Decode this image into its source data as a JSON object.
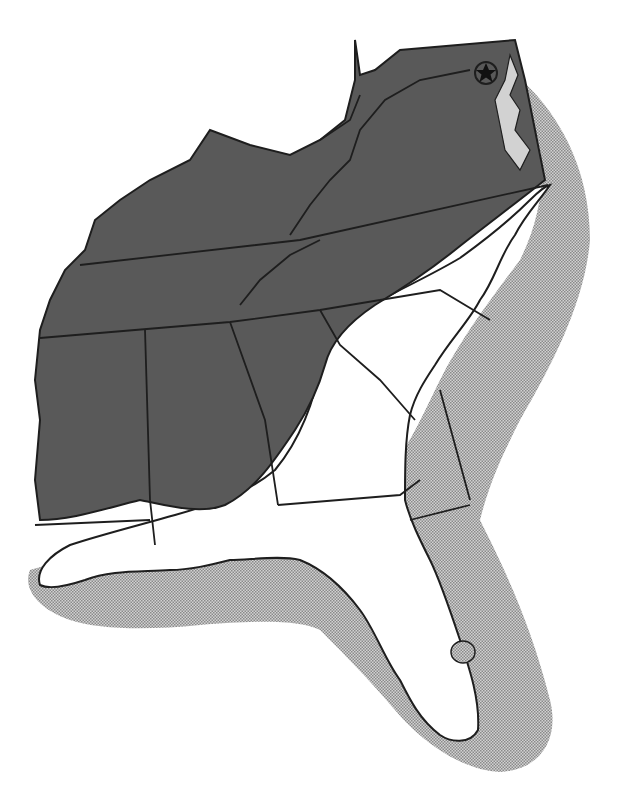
{
  "map": {
    "title": "",
    "region": "Southeastern United States",
    "colors": {
      "background": "#ffffff",
      "dark_range": "#595959",
      "light_stipple": "#b4b4b4",
      "land_unshaded": "#ffffff",
      "border": "#1e1e1e"
    },
    "legend": [],
    "layers": [
      {
        "name": "inland-range",
        "shade": "dark",
        "description": "Dark gray shaded inland range covering piedmont/mountain interior"
      },
      {
        "name": "coastal-range",
        "shade": "light-stipple",
        "description": "Light stippled band along Atlantic and Gulf coasts and offshore"
      },
      {
        "name": "coastal-plain",
        "shade": "white",
        "description": "Unshaded coastal plain"
      }
    ],
    "marker": {
      "symbol": "star-in-circle",
      "meaning": "capital",
      "location": "Washington, D.C."
    }
  }
}
